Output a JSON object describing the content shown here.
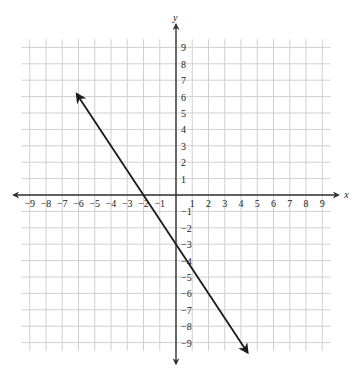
{
  "chart_data": {
    "type": "line",
    "title": "",
    "xlabel": "x",
    "ylabel": "y",
    "xlim": [
      -9,
      9
    ],
    "ylim": [
      -9,
      9
    ],
    "grid": true,
    "x_ticks": [
      -9,
      -8,
      -7,
      -6,
      -5,
      -4,
      -3,
      -2,
      -1,
      1,
      2,
      3,
      4,
      5,
      6,
      7,
      8,
      9
    ],
    "y_ticks": [
      9,
      8,
      7,
      6,
      5,
      4,
      3,
      2,
      1,
      -1,
      -2,
      -3,
      -4,
      -5,
      -6,
      -7,
      -8,
      -9
    ],
    "x_tick_labels": [
      "−9",
      "−8",
      "−7",
      "−6",
      "−5",
      "−4",
      "−3",
      "−2",
      "−1",
      "1",
      "2",
      "3",
      "4",
      "5",
      "6",
      "7",
      "8",
      "9"
    ],
    "y_tick_labels": [
      "9",
      "8",
      "7",
      "6",
      "5",
      "4",
      "3",
      "2",
      "1",
      "−1",
      "−2",
      "−3",
      "−4",
      "−5",
      "−6",
      "−7",
      "−8",
      "−9"
    ],
    "series": [
      {
        "name": "line",
        "equation": "y = -1.5x - 3",
        "slope": -1.5,
        "intercept": -3,
        "x_intercept": -2,
        "arrow_start": [
          -6.1,
          6.15
        ],
        "arrow_end": [
          4.4,
          -9.6
        ],
        "color": "#1a1a1a"
      }
    ]
  }
}
